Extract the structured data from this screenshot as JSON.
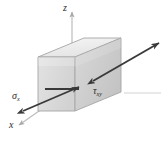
{
  "figure": {
    "type": "stress-element-diagram",
    "title": "",
    "background_color": "#ffffff",
    "width": 163,
    "height": 141
  },
  "axes": [
    {
      "id": "z",
      "label": "z",
      "direction": "up",
      "arrow": true,
      "x1": 72,
      "y1": 100,
      "x2": 72,
      "y2": 9,
      "color": "#b8b8b8"
    },
    {
      "id": "x",
      "label": "x",
      "direction": "down-left",
      "arrow": true,
      "x1": 60,
      "y1": 96,
      "x2": 17,
      "y2": 126,
      "color": "#b8b8b8"
    },
    {
      "id": "y",
      "label": "",
      "direction": "right",
      "arrow": false,
      "x1": 124,
      "y1": 93,
      "x2": 160,
      "y2": 93,
      "color": "#cfcfcf"
    }
  ],
  "element": {
    "name": "cubic-stress-element",
    "shape": "box",
    "faces": {
      "front_color": "#dcdcdc",
      "right_color": "#cfcfcf",
      "top_color": "#efefef",
      "edge_color": "#9a9a9a"
    },
    "vertices": {
      "front_top_left": [
        38,
        57
      ],
      "front_top_right": [
        75,
        57
      ],
      "front_bottom_left": [
        38,
        111
      ],
      "front_bottom_right": [
        75,
        111
      ],
      "back_top_left": [
        84,
        38
      ],
      "back_top_right": [
        121,
        38
      ],
      "back_bottom_right": [
        121,
        92
      ]
    }
  },
  "stresses": [
    {
      "id": "sigma-x",
      "symbol": "σ",
      "subscript": "x",
      "label_text": "σ",
      "kind": "normal-stress",
      "arrow_style": "double-headed",
      "color": "#3a3a3a",
      "from": [
        22,
        110
      ],
      "to": [
        78,
        87
      ],
      "label_position": [
        12,
        91
      ]
    },
    {
      "id": "tau-xy",
      "symbol": "τ",
      "subscript": "xy",
      "label_text": "τ",
      "kind": "shear-stress",
      "arrow_style": "double-headed",
      "color": "#3a3a3a",
      "from": [
        92,
        80
      ],
      "to": [
        158,
        44
      ],
      "label_position": [
        93,
        86
      ]
    }
  ],
  "labels": {
    "z_axis": "z",
    "x_axis": "x",
    "sigma_symbol": "σ",
    "sigma_subscript": "x",
    "tau_symbol": "τ",
    "tau_subscript": "xy"
  },
  "colors": {
    "background": "#ffffff",
    "axis": "#b8b8b8",
    "stress_arrow": "#3a3a3a",
    "box_edge": "#9a9a9a",
    "text": "#2b2b2b"
  }
}
